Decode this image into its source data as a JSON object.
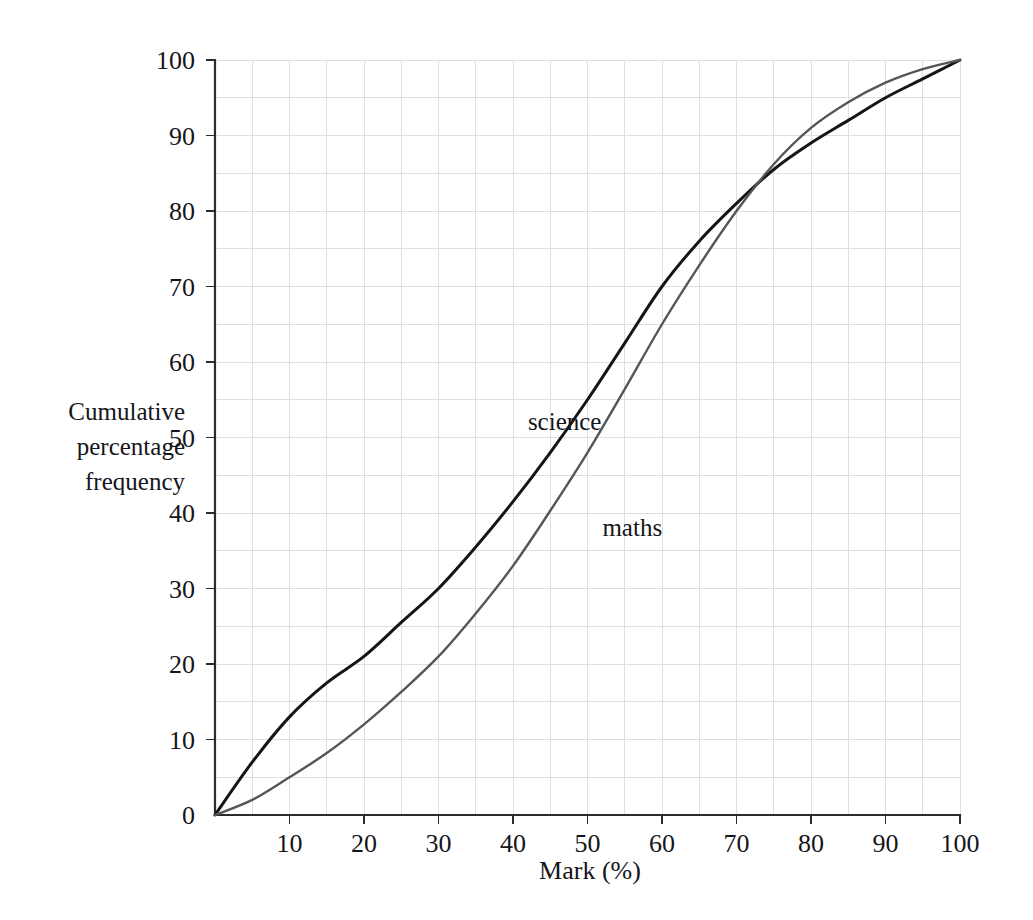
{
  "chart_data": {
    "type": "line",
    "title": "",
    "subtitle": "",
    "xlabel": "Mark (%)",
    "ylabel": "Cumulative percentage frequency",
    "ylabel_lines": [
      "Cumulative",
      "percentage",
      "frequency"
    ],
    "xlim": [
      0,
      100
    ],
    "ylim": [
      0,
      100
    ],
    "x_ticks": [
      0,
      10,
      20,
      30,
      40,
      50,
      60,
      70,
      80,
      90,
      100
    ],
    "x_tick_labels": [
      "0",
      "10",
      "20",
      "30",
      "40",
      "50",
      "60",
      "70",
      "80",
      "90",
      "100"
    ],
    "y_ticks": [
      0,
      10,
      20,
      30,
      40,
      50,
      60,
      70,
      80,
      90,
      100
    ],
    "y_tick_labels": [
      "0",
      "10",
      "20",
      "30",
      "40",
      "50",
      "60",
      "70",
      "80",
      "90",
      "100"
    ],
    "grid": true,
    "grid_step": 5,
    "grid_color": "#dcdfe6",
    "legend": "inline-labels",
    "x": [
      0,
      5,
      10,
      15,
      20,
      25,
      30,
      35,
      40,
      45,
      50,
      55,
      60,
      65,
      70,
      75,
      80,
      85,
      90,
      95,
      100
    ],
    "series": [
      {
        "name": "science",
        "color": "#151518",
        "stroke_width": 3,
        "label_x": 42,
        "label_y": 51,
        "values": [
          0,
          7,
          13,
          17.5,
          21,
          25.5,
          30,
          35.5,
          41.5,
          48,
          55,
          62.5,
          70,
          76,
          81,
          85.5,
          89,
          92,
          95,
          97.5,
          100
        ]
      },
      {
        "name": "maths",
        "color": "#565659",
        "stroke_width": 2.4,
        "label_x": 52,
        "label_y": 37,
        "values": [
          0,
          2,
          5,
          8.2,
          12,
          16.3,
          21,
          26.7,
          33,
          40.3,
          48,
          56.4,
          65,
          72.8,
          80,
          86.2,
          91,
          94.4,
          97,
          98.8,
          100
        ]
      }
    ]
  },
  "plot_geometry": {
    "origin_x": 215,
    "origin_y": 815,
    "plot_width": 745,
    "plot_height": 755
  }
}
